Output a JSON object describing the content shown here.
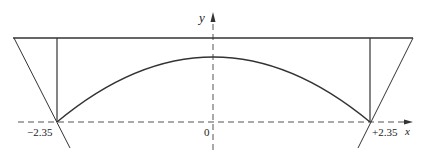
{
  "diagram": {
    "axes": {
      "x_label": "x",
      "y_label": "y",
      "origin_label": "0"
    },
    "ticks": {
      "left_label": "−2.35",
      "right_label": "+2.35"
    },
    "colors": {
      "line": "#333333",
      "axis": "#555555",
      "background": "#ffffff"
    },
    "elements": [
      "horizontal top line",
      "left vertical line at x = -2.35",
      "right vertical line at x = +2.35",
      "downward-opening parabola arc between x = -2.35 and x = +2.35",
      "left slanted line through (-2.35, 0)",
      "right slanted line through (+2.35, 0)",
      "dashed x-axis with arrow",
      "dashed y-axis with arrow"
    ]
  }
}
